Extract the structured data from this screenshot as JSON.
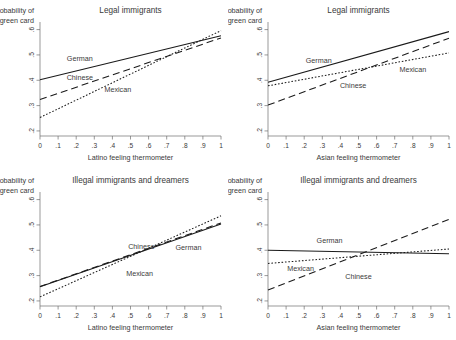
{
  "figure": {
    "panel_count": 4,
    "series_styles": {
      "German": "solid",
      "Chinese": "long-dash",
      "Mexican": "dotted"
    }
  },
  "chart_data": [
    {
      "id": "top-left",
      "type": "line",
      "title": "Legal immigrants",
      "xlabel": "Latino feeling thermometer",
      "ylabel": "Probability of green card",
      "xlim": [
        0,
        1
      ],
      "ylim": [
        0.18,
        0.63
      ],
      "xticks": [
        "0",
        ".1",
        ".2",
        ".3",
        ".4",
        ".5",
        ".6",
        ".7",
        ".8",
        ".9",
        "1"
      ],
      "xtickvals": [
        0,
        0.1,
        0.2,
        0.3,
        0.4,
        0.5,
        0.6,
        0.7,
        0.8,
        0.9,
        1
      ],
      "yticks": [
        ".2",
        ".3",
        ".4",
        ".5",
        ".6"
      ],
      "ytickvals": [
        0.2,
        0.3,
        0.4,
        0.5,
        0.6
      ],
      "grid": false,
      "legend": "inline-labels",
      "x": [
        0,
        1
      ],
      "series": [
        {
          "name": "German",
          "style": "solid",
          "values": [
            0.402,
            0.576
          ],
          "label_x": 0.22,
          "label_y": 0.478
        },
        {
          "name": "Chinese",
          "style": "long-dash",
          "values": [
            0.324,
            0.567
          ],
          "label_x": 0.22,
          "label_y": 0.4
        },
        {
          "name": "Mexican",
          "style": "dotted",
          "values": [
            0.253,
            0.596
          ],
          "label_x": 0.43,
          "label_y": 0.352
        }
      ]
    },
    {
      "id": "top-right",
      "type": "line",
      "title": "Legal immigrants",
      "xlabel": "Asian feeling thermometer",
      "ylabel": "Probability of green card",
      "xlim": [
        0,
        1
      ],
      "ylim": [
        0.18,
        0.63
      ],
      "xticks": [
        "0",
        ".1",
        ".2",
        ".3",
        ".4",
        ".5",
        ".6",
        ".7",
        ".8",
        ".9",
        "1"
      ],
      "xtickvals": [
        0,
        0.1,
        0.2,
        0.3,
        0.4,
        0.5,
        0.6,
        0.7,
        0.8,
        0.9,
        1
      ],
      "yticks": [
        ".2",
        ".3",
        ".4",
        ".5",
        ".6"
      ],
      "ytickvals": [
        0.2,
        0.3,
        0.4,
        0.5,
        0.6
      ],
      "grid": false,
      "legend": "inline-labels",
      "x": [
        0,
        1
      ],
      "series": [
        {
          "name": "German",
          "style": "solid",
          "values": [
            0.392,
            0.592
          ],
          "label_x": 0.28,
          "label_y": 0.47
        },
        {
          "name": "Chinese",
          "style": "long-dash",
          "values": [
            0.302,
            0.566
          ],
          "label_x": 0.47,
          "label_y": 0.368
        },
        {
          "name": "Mexican",
          "style": "dotted",
          "values": [
            0.378,
            0.508
          ],
          "label_x": 0.8,
          "label_y": 0.432
        }
      ]
    },
    {
      "id": "bottom-left",
      "type": "line",
      "title": "Illegal immigrants and dreamers",
      "xlabel": "Latino feeling thermometer",
      "ylabel": "Probability of green card",
      "xlim": [
        0,
        1
      ],
      "ylim": [
        0.18,
        0.63
      ],
      "xticks": [
        "0",
        ".1",
        ".2",
        ".3",
        ".4",
        ".5",
        ".6",
        ".7",
        ".8",
        ".9",
        "1"
      ],
      "xtickvals": [
        0,
        0.1,
        0.2,
        0.3,
        0.4,
        0.5,
        0.6,
        0.7,
        0.8,
        0.9,
        1
      ],
      "yticks": [
        ".2",
        ".3",
        ".4",
        ".5",
        ".6"
      ],
      "ytickvals": [
        0.2,
        0.3,
        0.4,
        0.5,
        0.6
      ],
      "grid": false,
      "legend": "inline-labels",
      "x": [
        0,
        1
      ],
      "series": [
        {
          "name": "German",
          "style": "solid",
          "values": [
            0.256,
            0.504
          ],
          "label_x": 0.82,
          "label_y": 0.4
        },
        {
          "name": "Chinese",
          "style": "long-dash",
          "values": [
            0.257,
            0.508
          ],
          "label_x": 0.56,
          "label_y": 0.406
        },
        {
          "name": "Mexican",
          "style": "dotted",
          "values": [
            0.216,
            0.536
          ],
          "label_x": 0.55,
          "label_y": 0.3
        }
      ]
    },
    {
      "id": "bottom-right",
      "type": "line",
      "title": "Illegal immigrants and dreamers",
      "xlabel": "Asian feeling thermometer",
      "ylabel": "Probability of green card",
      "xlim": [
        0,
        1
      ],
      "ylim": [
        0.18,
        0.63
      ],
      "xticks": [
        "0",
        ".1",
        ".2",
        ".3",
        ".4",
        ".5",
        ".6",
        ".7",
        ".8",
        ".9",
        "1"
      ],
      "xtickvals": [
        0,
        0.1,
        0.2,
        0.3,
        0.4,
        0.5,
        0.6,
        0.7,
        0.8,
        0.9,
        1
      ],
      "yticks": [
        ".2",
        ".3",
        ".4",
        ".5",
        ".6"
      ],
      "ytickvals": [
        0.2,
        0.3,
        0.4,
        0.5,
        0.6
      ],
      "grid": false,
      "legend": "inline-labels",
      "x": [
        0,
        1
      ],
      "series": [
        {
          "name": "German",
          "style": "solid",
          "values": [
            0.4,
            0.386
          ],
          "label_x": 0.34,
          "label_y": 0.428
        },
        {
          "name": "Chinese",
          "style": "long-dash",
          "values": [
            0.243,
            0.522
          ],
          "label_x": 0.5,
          "label_y": 0.288
        },
        {
          "name": "Mexican",
          "style": "dotted",
          "values": [
            0.348,
            0.405
          ],
          "label_x": 0.18,
          "label_y": 0.32
        }
      ]
    }
  ]
}
